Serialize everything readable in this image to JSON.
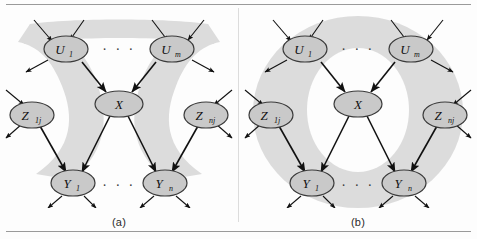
{
  "figure": {
    "panels": [
      {
        "id": "a",
        "caption": "(a)",
        "region_shape": "crossing-bands-hourglass",
        "region_color": "#dcdcdc"
      },
      {
        "id": "b",
        "caption": "(b)",
        "region_shape": "annulus-ring",
        "region_color": "#dcdcdc"
      }
    ],
    "ellipsis": "· · ·",
    "nodes": [
      {
        "key": "u1",
        "label": "U",
        "sub": "1",
        "title": "U1"
      },
      {
        "key": "um",
        "label": "U",
        "sub": "m",
        "title": "Um"
      },
      {
        "key": "x",
        "label": "X",
        "sub": "",
        "title": "X"
      },
      {
        "key": "z1j",
        "label": "Z",
        "sub": "1j",
        "title": "Z1j"
      },
      {
        "key": "znj",
        "label": "Z",
        "sub": "nj",
        "title": "Znj"
      },
      {
        "key": "y1",
        "label": "Y",
        "sub": "1",
        "title": "Y1"
      },
      {
        "key": "yn",
        "label": "Y",
        "sub": "n",
        "title": "Yn"
      }
    ],
    "edges": [
      {
        "from": "u1",
        "to": "x"
      },
      {
        "from": "um",
        "to": "x"
      },
      {
        "from": "x",
        "to": "y1"
      },
      {
        "from": "x",
        "to": "yn"
      },
      {
        "from": "z1j",
        "to": "y1"
      },
      {
        "from": "znj",
        "to": "yn"
      }
    ],
    "node_fill": "#c9c9c9",
    "node_stroke": "#3a3a3a",
    "edge_color": "#111111"
  }
}
